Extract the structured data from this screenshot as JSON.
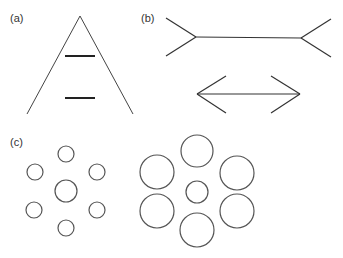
{
  "panels": {
    "a": {
      "label": "(a)",
      "name": "Ponzo illusion"
    },
    "b": {
      "label": "(b)",
      "name": "Müller-Lyer illusion"
    },
    "c": {
      "label": "(c)",
      "name": "Ebbinghaus illusion"
    }
  },
  "colors": {
    "stroke": "#333333",
    "background": "#ffffff"
  }
}
